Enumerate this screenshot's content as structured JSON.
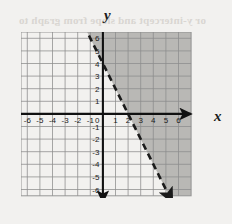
{
  "page": {
    "background_color": "#f2f1ef",
    "bleed_through_text": "or y-intercept and slope from graph to"
  },
  "axes": {
    "x_label": "x",
    "y_label": "y",
    "x_ticks": [
      "-6",
      "-5",
      "-4",
      "-3",
      "-2",
      "-1",
      "1",
      "2",
      "3",
      "4",
      "5",
      "6"
    ],
    "y_ticks": [
      "6",
      "5",
      "4",
      "3",
      "2",
      "1",
      "-1",
      "-2",
      "-3",
      "-4",
      "-5",
      "-6"
    ],
    "origin_label": "0",
    "axis_color": "#111111",
    "grid_color": "#8d8d8d"
  },
  "chart_data": {
    "type": "line",
    "title": "",
    "xlabel": "x",
    "ylabel": "y",
    "xlim": [
      -7,
      7
    ],
    "ylim": [
      -7,
      7
    ],
    "grid": true,
    "x_tick_values": [
      -6,
      -5,
      -4,
      -3,
      -2,
      -1,
      1,
      2,
      3,
      4,
      5,
      6
    ],
    "y_tick_values": [
      6,
      5,
      4,
      3,
      2,
      1,
      -1,
      -2,
      -3,
      -4,
      -5,
      -6
    ],
    "legend": "none",
    "series": [
      {
        "name": "boundary-line",
        "equation": "y = -2x + 4",
        "slope": -2,
        "y_intercept": 4,
        "x_intercept": 2,
        "line_style": "dashed",
        "arrows": "both",
        "color": "#1b1b1b",
        "points": [
          [
            -1.5,
            7
          ],
          [
            0,
            4
          ],
          [
            2,
            0
          ],
          [
            5.5,
            -7
          ]
        ]
      }
    ],
    "shaded_region": {
      "description": "region to the right of / below the dashed boundary line",
      "inequality": "y < -2x + 4",
      "boundary_included": false,
      "fill_color": "#b9b8b5"
    }
  }
}
